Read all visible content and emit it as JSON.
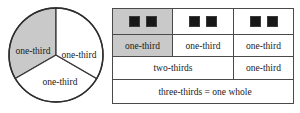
{
  "figure": {
    "colors": {
      "shade": "#c9c9c9",
      "stroke": "#4a4a4a",
      "tile": "#181818",
      "background": "#ffffff",
      "text": "#1a1a1a"
    }
  },
  "pie": {
    "name": "circle-divided-in-thirds",
    "slice_count": 3,
    "labels": {
      "left": "one-third",
      "right": "one-third",
      "bottom": "one-third"
    },
    "shaded_slice": "left"
  },
  "table": {
    "tiles_row": {
      "cell1": {
        "tile_count": 2,
        "shaded": true
      },
      "cell2": {
        "tile_count": 2,
        "shaded": false
      },
      "cell3": {
        "tile_count": 2,
        "shaded": false
      }
    },
    "thirds_row": {
      "cell1": "one-third",
      "cell2": "one-third",
      "cell3": "one-third"
    },
    "mixed_row": {
      "cell_span2": "two-thirds",
      "cell3": "one-third"
    },
    "whole_row": {
      "cell_span3": "three-thirds = one whole"
    }
  }
}
